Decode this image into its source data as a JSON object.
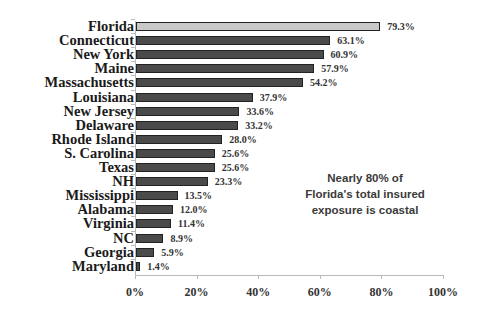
{
  "chart_data": {
    "type": "bar",
    "orientation": "horizontal",
    "title": "",
    "xlabel": "",
    "ylabel": "",
    "xlim": [
      0,
      100
    ],
    "x_ticks": [
      "0%",
      "20%",
      "40%",
      "60%",
      "80%",
      "100%"
    ],
    "categories": [
      "Florida",
      "Connecticut",
      "New York",
      "Maine",
      "Massachusetts",
      "Louisiana",
      "New Jersey",
      "Delaware",
      "Rhode Island",
      "S. Carolina",
      "Texas",
      "NH",
      "Mississippi",
      "Alabama",
      "Virginia",
      "NC",
      "Georgia",
      "Maryland"
    ],
    "values": [
      79.3,
      63.1,
      60.9,
      57.9,
      54.2,
      37.9,
      33.6,
      33.2,
      28.0,
      25.6,
      25.6,
      23.3,
      13.5,
      12.0,
      11.4,
      8.9,
      5.9,
      1.4
    ],
    "value_labels": [
      "79.3%",
      "63.1%",
      "60.9%",
      "57.9%",
      "54.2%",
      "37.9%",
      "33.6%",
      "33.2%",
      "28.0%",
      "25.6%",
      "25.6%",
      "23.3%",
      "13.5%",
      "12.0%",
      "11.4%",
      "8.9%",
      "5.9%",
      "1.4%"
    ],
    "highlighted_category": "Florida",
    "colors": {
      "highlight": "#c8c8c8",
      "default": "#4a4a4a",
      "border": "#222222"
    },
    "annotation": [
      "Nearly 80% of",
      "Florida's total insured",
      "exposure is coastal"
    ],
    "grid": false,
    "legend": null
  }
}
